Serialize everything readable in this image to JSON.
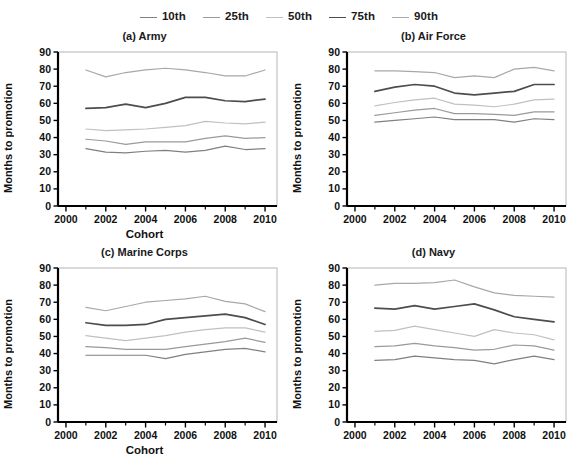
{
  "figure": {
    "background": "#ffffff",
    "axis_color": "#000000",
    "text_color": "#111111"
  },
  "legend": {
    "position": "top-center",
    "entries": [
      {
        "label": "10th",
        "color": "#808080"
      },
      {
        "label": "25th",
        "color": "#9a9a9a"
      },
      {
        "label": "50th",
        "color": "#c0c0c0"
      },
      {
        "label": "75th",
        "color": "#4d4d4d"
      },
      {
        "label": "90th",
        "color": "#a8a8a8"
      }
    ]
  },
  "axes": {
    "xlabel": "Cohort",
    "ylabel": "Months to promotion",
    "xticks": [
      2000,
      2002,
      2004,
      2006,
      2008,
      2010
    ],
    "xminor": [
      2001,
      2003,
      2005,
      2007,
      2009
    ],
    "yticks": [
      0,
      10,
      20,
      30,
      40,
      50,
      60,
      70,
      80,
      90
    ],
    "xlim": [
      1999.6,
      2010.6
    ],
    "ylim": [
      0,
      90
    ]
  },
  "chart_data": [
    {
      "type": "line",
      "title": "(a) Army",
      "panel": "a",
      "xlabel": "Cohort",
      "ylabel": "Months to promotion",
      "xlim": [
        1999.6,
        2010.6
      ],
      "ylim": [
        0,
        90
      ],
      "grid": false,
      "legend_position": "figure-top-center",
      "x": [
        2001,
        2002,
        2003,
        2004,
        2005,
        2006,
        2007,
        2008,
        2009,
        2010
      ],
      "series": [
        {
          "name": "10th",
          "color": "#808080",
          "values": [
            33.5,
            31.5,
            31.0,
            32.0,
            32.5,
            31.5,
            32.5,
            35.0,
            33.0,
            33.5
          ]
        },
        {
          "name": "25th",
          "color": "#9a9a9a",
          "values": [
            39.0,
            38.0,
            36.0,
            37.5,
            37.5,
            37.5,
            39.5,
            41.0,
            39.5,
            40.0
          ]
        },
        {
          "name": "50th",
          "color": "#c0c0c0",
          "values": [
            45.0,
            44.0,
            44.5,
            45.0,
            46.0,
            47.0,
            49.5,
            48.5,
            48.0,
            49.0
          ]
        },
        {
          "name": "75th",
          "color": "#4d4d4d",
          "values": [
            57.0,
            57.5,
            59.5,
            57.5,
            60.0,
            63.5,
            63.5,
            61.5,
            61.0,
            62.5
          ]
        },
        {
          "name": "90th",
          "color": "#a8a8a8",
          "values": [
            79.5,
            75.5,
            78.0,
            79.5,
            80.5,
            79.5,
            78.0,
            76.0,
            76.0,
            79.5
          ]
        }
      ]
    },
    {
      "type": "line",
      "title": "(b) Air Force",
      "panel": "b",
      "xlabel": "Cohort",
      "ylabel": "Months to promotion",
      "xlim": [
        1999.6,
        2010.6
      ],
      "ylim": [
        0,
        90
      ],
      "grid": false,
      "legend_position": "figure-top-center",
      "x": [
        2001,
        2002,
        2003,
        2004,
        2005,
        2006,
        2007,
        2008,
        2009,
        2010
      ],
      "series": [
        {
          "name": "10th",
          "color": "#808080",
          "values": [
            49.0,
            50.0,
            51.0,
            52.0,
            50.5,
            50.5,
            50.5,
            49.0,
            51.0,
            50.5
          ]
        },
        {
          "name": "25th",
          "color": "#9a9a9a",
          "values": [
            53.0,
            54.5,
            56.0,
            57.0,
            54.0,
            54.0,
            53.5,
            53.0,
            55.0,
            55.0
          ]
        },
        {
          "name": "50th",
          "color": "#c0c0c0",
          "values": [
            58.5,
            60.5,
            62.0,
            63.0,
            59.5,
            59.0,
            58.0,
            59.5,
            62.0,
            62.5
          ]
        },
        {
          "name": "75th",
          "color": "#4d4d4d",
          "values": [
            67.0,
            69.5,
            71.0,
            70.0,
            66.0,
            65.0,
            66.0,
            67.0,
            71.0,
            71.0
          ]
        },
        {
          "name": "90th",
          "color": "#a8a8a8",
          "values": [
            79.0,
            79.0,
            78.5,
            78.0,
            75.0,
            76.0,
            75.0,
            80.0,
            81.0,
            79.0
          ]
        }
      ]
    },
    {
      "type": "line",
      "title": "(c) Marine Corps",
      "panel": "c",
      "xlabel": "Cohort",
      "ylabel": "Months to promotion",
      "xlim": [
        1999.6,
        2010.6
      ],
      "ylim": [
        0,
        90
      ],
      "grid": false,
      "legend_position": "figure-top-center",
      "x": [
        2001,
        2002,
        2003,
        2004,
        2005,
        2006,
        2007,
        2008,
        2009,
        2010
      ],
      "series": [
        {
          "name": "10th",
          "color": "#808080",
          "values": [
            39.0,
            39.0,
            39.0,
            39.0,
            37.0,
            39.5,
            41.0,
            42.5,
            43.0,
            41.0
          ]
        },
        {
          "name": "25th",
          "color": "#9a9a9a",
          "values": [
            44.0,
            43.5,
            42.5,
            42.5,
            42.5,
            44.0,
            45.5,
            47.0,
            49.0,
            46.5
          ]
        },
        {
          "name": "50th",
          "color": "#c0c0c0",
          "values": [
            50.5,
            49.0,
            47.5,
            49.0,
            50.5,
            52.5,
            54.0,
            55.0,
            55.0,
            52.5
          ]
        },
        {
          "name": "75th",
          "color": "#4d4d4d",
          "values": [
            58.0,
            56.5,
            56.5,
            57.0,
            60.0,
            61.0,
            62.0,
            63.0,
            61.0,
            57.0
          ]
        },
        {
          "name": "90th",
          "color": "#a8a8a8",
          "values": [
            67.0,
            65.0,
            67.5,
            70.0,
            71.0,
            72.0,
            73.5,
            70.5,
            69.0,
            64.5
          ]
        }
      ]
    },
    {
      "type": "line",
      "title": "(d) Navy",
      "panel": "d",
      "xlabel": "Cohort",
      "ylabel": "Months to promotion",
      "xlim": [
        1999.6,
        2010.6
      ],
      "ylim": [
        0,
        90
      ],
      "grid": false,
      "legend_position": "figure-top-center",
      "x": [
        2001,
        2002,
        2003,
        2004,
        2005,
        2006,
        2007,
        2008,
        2009,
        2010
      ],
      "series": [
        {
          "name": "10th",
          "color": "#808080",
          "values": [
            36.0,
            36.5,
            38.5,
            37.5,
            36.5,
            36.0,
            34.0,
            36.5,
            38.5,
            36.5
          ]
        },
        {
          "name": "25th",
          "color": "#9a9a9a",
          "values": [
            44.0,
            44.5,
            46.0,
            44.5,
            43.5,
            42.0,
            42.5,
            45.0,
            44.5,
            42.0
          ]
        },
        {
          "name": "50th",
          "color": "#c0c0c0",
          "values": [
            53.0,
            53.5,
            56.0,
            54.0,
            52.0,
            50.0,
            54.0,
            52.0,
            51.0,
            48.0
          ]
        },
        {
          "name": "75th",
          "color": "#4d4d4d",
          "values": [
            66.5,
            66.0,
            68.0,
            66.0,
            67.5,
            69.0,
            65.5,
            61.5,
            60.0,
            58.5
          ]
        },
        {
          "name": "90th",
          "color": "#a8a8a8",
          "values": [
            80.0,
            81.0,
            81.0,
            81.5,
            83.0,
            79.0,
            75.5,
            74.0,
            73.5,
            73.0
          ]
        }
      ]
    }
  ]
}
